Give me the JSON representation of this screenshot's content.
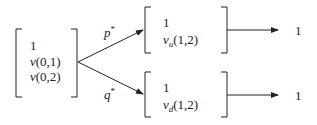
{
  "diagram": {
    "root": {
      "entries": [
        "1",
        "v(0,1)",
        "v(0,2)"
      ]
    },
    "branches": [
      {
        "edge_label": "p",
        "edge_label_sup": "*",
        "node": {
          "entries": [
            "1",
            "v_u(1,2)"
          ],
          "entry_text": [
            "1",
            "v",
            "u",
            "(1,2)"
          ]
        },
        "output": "1"
      },
      {
        "edge_label": "q",
        "edge_label_sup": "*",
        "node": {
          "entries": [
            "1",
            "v_d(1,2)"
          ],
          "entry_text": [
            "1",
            "v",
            "d",
            "(1,2)"
          ]
        },
        "output": "1"
      }
    ],
    "colors": {
      "stroke": "#222222",
      "background": "#ffffff"
    }
  }
}
